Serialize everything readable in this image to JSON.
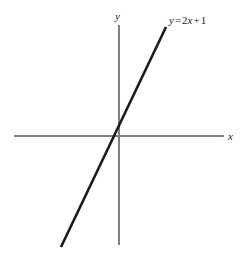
{
  "figure": {
    "background_color": "#ffffff",
    "width": 243,
    "height": 256
  },
  "axes": {
    "color": "#808080",
    "stroke_width": 1.5,
    "x_axis": {
      "label": "x",
      "x1": 14,
      "y1": 136,
      "x2": 224,
      "y2": 136
    },
    "y_axis": {
      "label": "y",
      "x1": 119,
      "y1": 25,
      "x2": 119,
      "y2": 245
    },
    "origin": {
      "x": 119,
      "y": 136
    }
  },
  "line": {
    "color": "#1a1a1a",
    "stroke_width": 2.6,
    "x1": 61,
    "y1": 247,
    "x2": 166,
    "y2": 27
  },
  "equation": {
    "full_text": "y = 2x + 1",
    "lhs": "y",
    "equals": "=",
    "coefficient": "2",
    "variable": "x",
    "plus": "+",
    "constant": "1"
  },
  "chart_data": {
    "type": "line",
    "title": "",
    "xlabel": "x",
    "ylabel": "y",
    "annotations": [
      "y = 2x + 1"
    ],
    "grid": false,
    "legend": null,
    "equation": "y = 2x + 1",
    "slope": 2,
    "intercept": 1,
    "xlim": [
      -3.1,
      2.3
    ],
    "ylim": [
      -5.1,
      5.1
    ],
    "x": [
      -3,
      -2,
      -1,
      0,
      1,
      2
    ],
    "y": [
      -5,
      -3,
      -1,
      1,
      3,
      5
    ],
    "series": [
      {
        "name": "y = 2x + 1",
        "x": [
          -3,
          -2,
          -1,
          0,
          1,
          2
        ],
        "values": [
          -5,
          -3,
          -1,
          1,
          3,
          5
        ]
      }
    ]
  }
}
